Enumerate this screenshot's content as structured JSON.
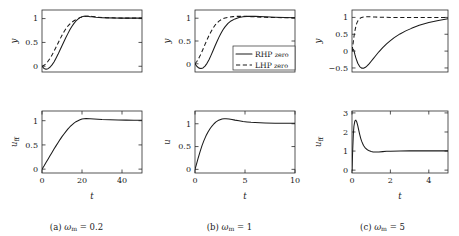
{
  "figure": {
    "type": "multi-panel-line-chart",
    "panels": 3,
    "rows_per_panel": 2,
    "series_names": [
      "RHP zero",
      "LHP zero"
    ],
    "legend_panel": "b",
    "legend_position": "lower-right-of-top-plot"
  },
  "legend": {
    "entries": [
      {
        "label_main": "RHP",
        "label_sub": "zero",
        "style": "solid"
      },
      {
        "label_main": "LHP",
        "label_sub": "zero",
        "style": "dashed"
      }
    ]
  },
  "captions": {
    "a": {
      "tag": "(a)",
      "symbol": "ω",
      "sub": "m",
      "eq": "= 0.2"
    },
    "b": {
      "tag": "(b)",
      "symbol": "ω",
      "sub": "m",
      "eq": "= 1"
    },
    "c": {
      "tag": "(c)",
      "symbol": "ω",
      "sub": "m",
      "eq": "= 5"
    }
  },
  "chart_data": [
    {
      "id": "a-top",
      "type": "line",
      "panel": "a",
      "title": "",
      "xlabel": "",
      "ylabel": "y",
      "ylabel_sub": "",
      "xlim": [
        0,
        50
      ],
      "ylim": [
        -0.12,
        1.18
      ],
      "xticks": [],
      "xticklabels": [],
      "yticks": [
        0,
        0.5,
        1
      ],
      "yticklabels": [
        "0",
        "0.5",
        "1"
      ],
      "grid": false,
      "series": [
        {
          "name": "RHP zero",
          "style": "solid",
          "x": [
            0,
            1,
            2,
            3,
            4,
            5,
            6,
            7,
            8,
            9,
            10,
            11,
            12,
            13,
            14,
            15,
            16,
            17,
            18,
            19,
            20,
            21,
            22,
            23,
            24,
            25,
            27,
            30,
            33,
            36,
            40,
            45,
            50
          ],
          "y": [
            0,
            -0.045,
            -0.06,
            -0.05,
            -0.02,
            0.03,
            0.09,
            0.17,
            0.25,
            0.34,
            0.43,
            0.52,
            0.61,
            0.69,
            0.77,
            0.84,
            0.9,
            0.95,
            0.99,
            1.02,
            1.04,
            1.05,
            1.05,
            1.05,
            1.04,
            1.04,
            1.03,
            1.02,
            1.015,
            1.012,
            1.01,
            1.01,
            1.01
          ]
        },
        {
          "name": "LHP zero",
          "style": "dashed",
          "x": [
            0,
            1,
            2,
            3,
            4,
            5,
            6,
            7,
            8,
            9,
            10,
            11,
            12,
            13,
            14,
            15,
            16,
            17,
            18,
            19,
            20,
            21,
            22,
            23,
            25,
            28,
            32,
            36,
            40,
            45,
            50
          ],
          "y": [
            0,
            0.02,
            0.055,
            0.105,
            0.165,
            0.235,
            0.315,
            0.4,
            0.485,
            0.57,
            0.65,
            0.725,
            0.79,
            0.845,
            0.89,
            0.925,
            0.955,
            0.98,
            1.0,
            1.02,
            1.035,
            1.045,
            1.05,
            1.05,
            1.045,
            1.03,
            1.02,
            1.015,
            1.01,
            1.01,
            1.01
          ]
        }
      ]
    },
    {
      "id": "a-bottom",
      "type": "line",
      "panel": "a",
      "title": "",
      "xlabel": "t",
      "ylabel": "u",
      "ylabel_sub": "ff",
      "xlim": [
        0,
        50
      ],
      "ylim": [
        -0.08,
        1.2
      ],
      "xticks": [
        0,
        20,
        40
      ],
      "xticklabels": [
        "0",
        "20",
        "40"
      ],
      "yticks": [
        0,
        0.5,
        1
      ],
      "yticklabels": [
        "0",
        "0.5",
        "1"
      ],
      "grid": false,
      "series": [
        {
          "name": "u_ff",
          "style": "solid",
          "x": [
            0,
            1,
            2,
            3,
            4,
            5,
            6,
            7,
            8,
            9,
            10,
            11,
            12,
            13,
            14,
            15,
            16,
            17,
            18,
            19,
            20,
            21,
            22,
            24,
            26,
            28,
            30,
            34,
            38,
            42,
            46,
            50
          ],
          "y": [
            0,
            0.065,
            0.135,
            0.205,
            0.275,
            0.345,
            0.415,
            0.48,
            0.545,
            0.61,
            0.67,
            0.725,
            0.78,
            0.83,
            0.875,
            0.915,
            0.95,
            0.98,
            1.0,
            1.02,
            1.035,
            1.04,
            1.045,
            1.04,
            1.035,
            1.03,
            1.025,
            1.02,
            1.015,
            1.012,
            1.01,
            1.01
          ]
        }
      ]
    },
    {
      "id": "b-top",
      "type": "line",
      "panel": "b",
      "title": "",
      "xlabel": "",
      "ylabel": "y",
      "ylabel_sub": "",
      "xlim": [
        0,
        10
      ],
      "ylim": [
        -0.18,
        1.18
      ],
      "xticks": [],
      "xticklabels": [],
      "yticks": [
        0,
        0.5,
        1
      ],
      "yticklabels": [
        "0",
        "0.5",
        "1"
      ],
      "grid": false,
      "series": [
        {
          "name": "RHP zero",
          "style": "solid",
          "x": [
            0,
            0.2,
            0.4,
            0.6,
            0.8,
            1.0,
            1.2,
            1.4,
            1.6,
            1.8,
            2.0,
            2.2,
            2.4,
            2.6,
            2.8,
            3.0,
            3.3,
            3.6,
            4.0,
            4.4,
            4.8,
            5.2,
            5.6,
            6.0,
            7.0,
            8.0,
            9.0,
            10.0
          ],
          "y": [
            0,
            -0.06,
            -0.095,
            -0.105,
            -0.09,
            -0.05,
            0.01,
            0.09,
            0.185,
            0.285,
            0.39,
            0.49,
            0.585,
            0.67,
            0.745,
            0.81,
            0.885,
            0.94,
            0.985,
            1.015,
            1.03,
            1.04,
            1.04,
            1.04,
            1.03,
            1.02,
            1.015,
            1.012
          ]
        },
        {
          "name": "LHP zero",
          "style": "dashed",
          "x": [
            0,
            0.2,
            0.4,
            0.6,
            0.8,
            1.0,
            1.2,
            1.4,
            1.6,
            1.8,
            2.0,
            2.2,
            2.4,
            2.6,
            2.8,
            3.0,
            3.4,
            3.8,
            4.2,
            4.6,
            5.0,
            6.0,
            7.0,
            8.0,
            9.0,
            10.0
          ],
          "y": [
            0,
            0.055,
            0.13,
            0.22,
            0.32,
            0.425,
            0.525,
            0.62,
            0.705,
            0.78,
            0.845,
            0.895,
            0.935,
            0.965,
            0.99,
            1.005,
            1.025,
            1.035,
            1.04,
            1.04,
            1.04,
            1.03,
            1.02,
            1.015,
            1.012,
            1.01
          ]
        }
      ]
    },
    {
      "id": "b-bottom",
      "type": "line",
      "panel": "b",
      "title": "",
      "xlabel": "t",
      "ylabel": "u",
      "ylabel_sub": "",
      "xlim": [
        0,
        10
      ],
      "ylim": [
        -0.08,
        1.28
      ],
      "xticks": [
        0,
        5,
        10
      ],
      "xticklabels": [
        "0",
        "5",
        "10"
      ],
      "yticks": [
        0,
        0.5,
        1
      ],
      "yticklabels": [
        "0",
        "0.5",
        "1"
      ],
      "grid": false,
      "series": [
        {
          "name": "u",
          "style": "solid",
          "x": [
            0,
            0.15,
            0.3,
            0.5,
            0.7,
            0.9,
            1.1,
            1.3,
            1.5,
            1.7,
            1.9,
            2.1,
            2.3,
            2.5,
            2.7,
            2.9,
            3.1,
            3.4,
            3.7,
            4.0,
            4.4,
            4.8,
            5.2,
            5.6,
            6.0,
            6.5,
            7.0,
            8.0,
            9.0,
            10.0
          ],
          "y": [
            0,
            0.115,
            0.235,
            0.385,
            0.52,
            0.635,
            0.735,
            0.82,
            0.89,
            0.95,
            1.0,
            1.04,
            1.07,
            1.09,
            1.105,
            1.11,
            1.11,
            1.105,
            1.095,
            1.08,
            1.065,
            1.05,
            1.04,
            1.032,
            1.026,
            1.02,
            1.016,
            1.012,
            1.01,
            1.01
          ]
        }
      ]
    },
    {
      "id": "c-top",
      "type": "line",
      "panel": "c",
      "title": "",
      "xlabel": "",
      "ylabel": "y",
      "ylabel_sub": "",
      "xlim": [
        0,
        5
      ],
      "ylim": [
        -0.62,
        1.22
      ],
      "xticks": [],
      "xticklabels": [],
      "yticks": [
        -0.5,
        0,
        0.5,
        1
      ],
      "yticklabels": [
        "−0.5",
        "0",
        "0.5",
        "1"
      ],
      "grid": false,
      "series": [
        {
          "name": "RHP zero",
          "style": "solid",
          "x": [
            0,
            0.05,
            0.1,
            0.15,
            0.2,
            0.3,
            0.4,
            0.5,
            0.6,
            0.7,
            0.8,
            0.9,
            1.0,
            1.1,
            1.2,
            1.4,
            1.6,
            1.8,
            2.0,
            2.2,
            2.5,
            2.8,
            3.1,
            3.5,
            4.0,
            4.5,
            5.0
          ],
          "y": [
            0,
            0.06,
            0.02,
            -0.1,
            -0.2,
            -0.36,
            -0.46,
            -0.505,
            -0.51,
            -0.48,
            -0.43,
            -0.37,
            -0.3,
            -0.23,
            -0.16,
            -0.02,
            0.105,
            0.215,
            0.31,
            0.4,
            0.51,
            0.6,
            0.675,
            0.765,
            0.85,
            0.91,
            0.96
          ]
        },
        {
          "name": "LHP zero",
          "style": "dashed",
          "x": [
            0,
            0.05,
            0.1,
            0.15,
            0.2,
            0.25,
            0.3,
            0.35,
            0.4,
            0.45,
            0.5,
            0.6,
            0.7,
            0.8,
            0.9,
            1.0,
            1.2,
            1.5,
            2.0,
            2.5,
            3.0,
            3.5,
            4.0,
            4.5,
            5.0
          ],
          "y": [
            0,
            0.2,
            0.42,
            0.6,
            0.73,
            0.83,
            0.89,
            0.935,
            0.965,
            0.985,
            1.0,
            1.015,
            1.02,
            1.02,
            1.02,
            1.015,
            1.01,
            1.005,
            1.0,
            1.0,
            1.0,
            1.0,
            1.0,
            1.0,
            1.0
          ]
        }
      ]
    },
    {
      "id": "c-bottom",
      "type": "line",
      "panel": "c",
      "title": "",
      "xlabel": "t",
      "ylabel": "u",
      "ylabel_sub": "ff",
      "xlim": [
        0,
        5
      ],
      "ylim": [
        -0.15,
        3.1
      ],
      "xticks": [
        0,
        2,
        4
      ],
      "xticklabels": [
        "0",
        "2",
        "4"
      ],
      "yticks": [
        0,
        1,
        2,
        3
      ],
      "yticklabels": [
        "0",
        "1",
        "2",
        "3"
      ],
      "grid": false,
      "series": [
        {
          "name": "u_ff",
          "style": "solid",
          "x": [
            0,
            0.03,
            0.07,
            0.1,
            0.15,
            0.2,
            0.25,
            0.3,
            0.35,
            0.4,
            0.45,
            0.5,
            0.6,
            0.7,
            0.8,
            0.9,
            1.0,
            1.1,
            1.2,
            1.4,
            1.6,
            1.8,
            2.0,
            2.5,
            3.0,
            3.5,
            4.0,
            4.5,
            5.0
          ],
          "y": [
            0,
            0.9,
            1.9,
            2.3,
            2.58,
            2.62,
            2.52,
            2.33,
            2.1,
            1.88,
            1.68,
            1.52,
            1.29,
            1.15,
            1.07,
            1.01,
            0.975,
            0.955,
            0.95,
            0.955,
            0.97,
            0.985,
            0.995,
            1.005,
            1.01,
            1.01,
            1.01,
            1.01,
            1.01
          ]
        }
      ]
    }
  ]
}
